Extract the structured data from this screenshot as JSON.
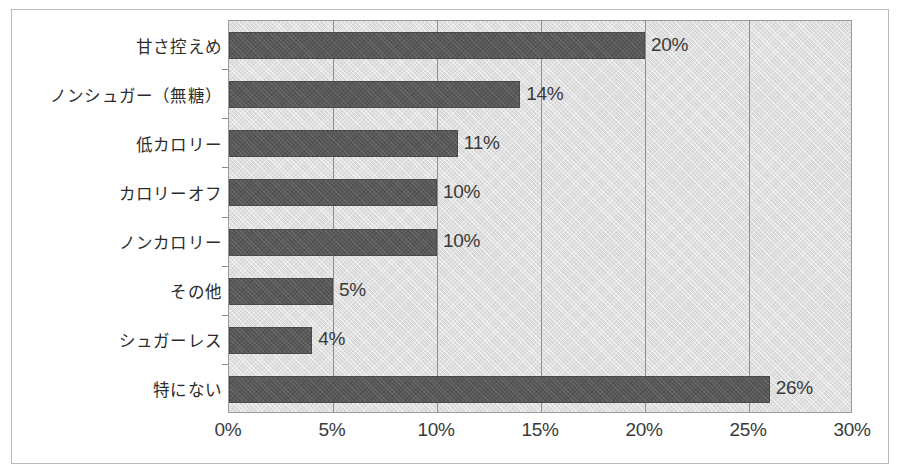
{
  "chart_data": {
    "type": "bar",
    "orientation": "horizontal",
    "title": "",
    "xlabel": "",
    "ylabel": "",
    "categories": [
      "甘さ控えめ",
      "ノンシュガー（無糖）",
      "低カロリー",
      "カロリーオフ",
      "ノンカロリー",
      "その他",
      "シュガーレス",
      "特にない"
    ],
    "values": [
      20,
      14,
      11,
      10,
      10,
      5,
      4,
      26
    ],
    "data_labels": [
      "20%",
      "14%",
      "11%",
      "10%",
      "10%",
      "5%",
      "4%",
      "26%"
    ],
    "xlim": [
      0,
      30
    ],
    "xticks": [
      0,
      5,
      10,
      15,
      20,
      25,
      30
    ],
    "xtick_labels": [
      "0%",
      "5%",
      "10%",
      "15%",
      "20%",
      "25%",
      "30%"
    ],
    "grid": true,
    "legend": false,
    "colors": {
      "bar": "#585858",
      "plot_background": "#d6d6d6",
      "gridline": "#8f8f8f",
      "text": "#2b2b2b",
      "frame": "#b9b9b9"
    }
  }
}
